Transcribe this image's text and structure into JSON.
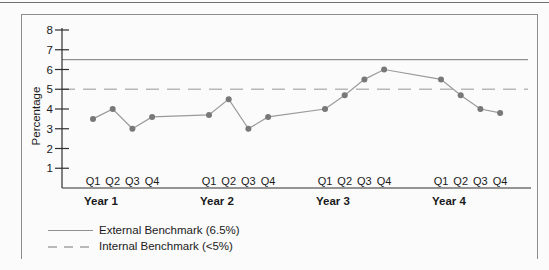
{
  "chart_data": {
    "type": "line",
    "title": "",
    "xlabel": "",
    "ylabel": "Percentage",
    "ylim": [
      0,
      8
    ],
    "yticks": [
      1,
      2,
      3,
      4,
      5,
      6,
      7,
      8
    ],
    "grid": false,
    "legend_position": "bottom-left",
    "year_groups": [
      "Year 1",
      "Year 2",
      "Year 3",
      "Year 4"
    ],
    "quarters": [
      "Q1",
      "Q2",
      "Q3",
      "Q4"
    ],
    "series": [
      {
        "name": "Percentage by quarter",
        "values": [
          3.5,
          4.0,
          3.0,
          3.6,
          3.7,
          4.5,
          3.0,
          3.6,
          4.0,
          4.7,
          5.5,
          6.0,
          5.5,
          4.7,
          4.0,
          3.8
        ],
        "line_color": "#9a9a9a",
        "marker_color": "#787878"
      }
    ],
    "benchmarks": [
      {
        "name": "External Benchmark (6.5%)",
        "value": 6.5,
        "style": "solid",
        "color": "#8f8f8f"
      },
      {
        "name": "Internal Benchmark (<5%)",
        "value": 5.0,
        "style": "dashed",
        "color": "#b8b8b8"
      }
    ],
    "axis_color": "#2f2f2f"
  }
}
